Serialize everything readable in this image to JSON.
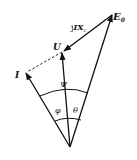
{
  "diagram": {
    "type": "phasor-diagram",
    "labels": {
      "E0": "E",
      "E0_sub": "0",
      "U": "U",
      "I": "I",
      "jIXc_prefix": "j",
      "jIXc_main": "IX",
      "jIXc_sub": "c",
      "psi": "Ψ",
      "phi": "φ",
      "theta": "θ"
    },
    "colors": {
      "stroke": "#111111",
      "background": "#ffffff"
    }
  }
}
